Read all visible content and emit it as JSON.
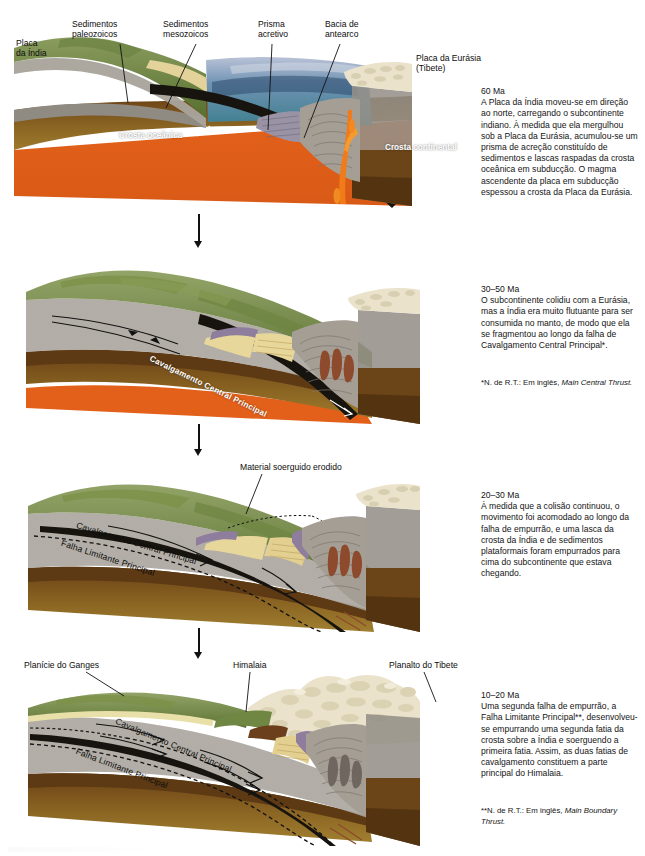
{
  "figure": {
    "language": "pt-BR"
  },
  "colors": {
    "continental_crust_gray": "#a9a49c",
    "oceanic_crust_black": "#15120e",
    "mantle_brown": "#6b4418",
    "mantle_tan": "#8f6a25",
    "asthenosphere_orange": "#e4641d",
    "vegetation_green": "#7d934f",
    "vegetation_dark_green": "#5c7337",
    "snow_cream": "#ece4cc",
    "sediment_yellow": "#e8d79a",
    "ocean_blue": "#5d7fa8",
    "ocean_teal": "#3f8c93",
    "magma_orange": "#f07b18",
    "purple_sliver": "#8e7d9c",
    "leader_line": "#111111",
    "text": "#151515"
  },
  "stages": [
    {
      "id": "stage-60ma",
      "age": "60 Ma",
      "body": "A Placa da Índia moveu-se em direção ao norte, carregando o subcontinente indiano. À medida que ela mergulhou sob a Placa da Eurásia, acumulou-se um prisma de acreção constituído de sedimentos e lascas raspadas da crosta oceânica em subducção. O magma ascendente da placa em subducção espessou a crosta da Placa da Eurásia.",
      "note": null,
      "labels": [
        {
          "name": "label-placa-da-india",
          "text": "Placa\nda Índia",
          "x": 16,
          "y": 38,
          "leader": null
        },
        {
          "name": "label-sedimentos-paleozoicos",
          "text": "Sedimentos\npaleozoicos",
          "x": 72,
          "y": 19,
          "leader": {
            "x1": 120,
            "y1": 44,
            "x2": 128,
            "y2": 103
          }
        },
        {
          "name": "label-sedimentos-mesozoicos",
          "text": "Sedimentos\nmesozoicos",
          "x": 163,
          "y": 19,
          "leader": {
            "x1": 196,
            "y1": 44,
            "x2": 166,
            "y2": 108
          }
        },
        {
          "name": "label-prisma-acretivo",
          "text": "Prisma\nacretivo",
          "x": 258,
          "y": 19,
          "leader": {
            "x1": 272,
            "y1": 44,
            "x2": 266,
            "y2": 132
          }
        },
        {
          "name": "label-bacia-de-antearco",
          "text": "Bacia de\nantearco",
          "x": 325,
          "y": 19,
          "leader": {
            "x1": 340,
            "y1": 44,
            "x2": 302,
            "y2": 140
          }
        },
        {
          "name": "label-placa-da-eurasia",
          "text": "Placa da Eurásia\n(Tibete)",
          "x": 416,
          "y": 53,
          "leader": null
        },
        {
          "name": "label-crosta-oceanica",
          "text": "Crosta oceânica",
          "x": 119,
          "y": 131,
          "leader": {
            "x1": 196,
            "y1": 134,
            "x2": 208,
            "y2": 125
          },
          "white": true
        },
        {
          "name": "label-crosta-continental",
          "text": "Crosta\ncontinental",
          "x": 385,
          "y": 143,
          "leader": null,
          "white": true
        }
      ]
    },
    {
      "id": "stage-30-50ma",
      "age": "30–50 Ma",
      "body": "O subcontinente colidiu com a Eurásia, mas a Índia era muito flutuante para ser consumida no manto, de modo que ela se fragmentou ao longo da falha de Cavalgamento Central Principal*.",
      "note": "*N. de R.T.: Em inglês, Main Central Thrust.",
      "note_italic": "Main Central Thrust.",
      "note_plain": "*N. de R.T.: Em inglês, ",
      "labels": [
        {
          "name": "label-cavalgamento-central-principal",
          "text": "Cavalgamento Central Principal",
          "x": 152,
          "y": 354,
          "rotate": 26,
          "white": true
        }
      ]
    },
    {
      "id": "stage-20-30ma",
      "age": "20–30 Ma",
      "body": "À medida que a colisão continuou, o movimento foi acomodado ao longo da falha de empurrão, e uma lasca da crosta da Índia e de sedimentos plataformais foram empurrados para cima do subcontinente que estava chegando.",
      "note": null,
      "labels": [
        {
          "name": "label-material-soerguido-erodido",
          "text": "Material soerguido erodido",
          "x": 240,
          "y": 462,
          "leader": {
            "x1": 262,
            "y1": 474,
            "x2": 246,
            "y2": 512
          }
        },
        {
          "name": "label-cavalgamento-central-principal",
          "text": "Cavalgamento Central Principal",
          "x": 157,
          "y": 518,
          "rotate": 16,
          "white": false
        },
        {
          "name": "label-falha-limitante-principal",
          "text": "Falha Limitante Principal",
          "x": 130,
          "y": 538,
          "rotate": 17,
          "white": false
        }
      ]
    },
    {
      "id": "stage-10-20ma",
      "age": "10–20 Ma",
      "body": "Uma segunda falha de empurrão, a Falha Limitante Principal**, desenvolveu-se empurrando uma segunda fatia da crosta sobre a Índia e soerguendo a primeira fatia. Assim, as duas fatias de cavalgamento constituem a parte principal do Himalaia.",
      "note": "**N. de R.T.: Em inglês, Main Boundary Thrust.",
      "note_italic": "Main Boundary Thrust.",
      "note_plain": "**N. de R.T.: Em inglês, ",
      "labels": [
        {
          "name": "label-planicie-do-ganges",
          "text": "Planície do Ganges",
          "x": 24,
          "y": 660,
          "leader": {
            "x1": 86,
            "y1": 672,
            "x2": 124,
            "y2": 694
          }
        },
        {
          "name": "label-himalaia",
          "text": "Himalaia",
          "x": 233,
          "y": 660,
          "leader": {
            "x1": 250,
            "y1": 672,
            "x2": 246,
            "y2": 712
          }
        },
        {
          "name": "label-planalto-do-tibete",
          "text": "Planalto do Tibete",
          "x": 389,
          "y": 660,
          "leader": {
            "x1": 424,
            "y1": 672,
            "x2": 436,
            "y2": 702
          }
        },
        {
          "name": "label-cavalgamento-central-principal",
          "text": "Cavalgamento Central Principal",
          "x": 193,
          "y": 718,
          "rotate": 22,
          "white": false
        },
        {
          "name": "label-falha-limitante-principal",
          "text": "Falha Limitante Principal",
          "x": 148,
          "y": 752,
          "rotate": 20,
          "white": false
        }
      ]
    }
  ],
  "arrows": [
    {
      "name": "stage-arrow-1",
      "x": 198,
      "y": 214,
      "height": 34
    },
    {
      "name": "stage-arrow-2",
      "x": 198,
      "y": 424,
      "height": 32
    },
    {
      "name": "stage-arrow-3",
      "x": 198,
      "y": 630,
      "height": 30
    }
  ]
}
